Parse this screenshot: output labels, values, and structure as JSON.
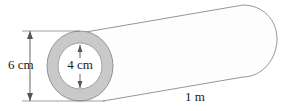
{
  "figure": {
    "shape_type": "hollow-cylinder",
    "colors": {
      "annulus_fill": "#c9c9c9",
      "inner_fill": "#ffffff",
      "body_fill": "#fdfdfd",
      "outline": "#8a8a8a",
      "dimension_line": "#555555",
      "text": "#1a1a1a",
      "background": "#ffffff"
    },
    "dimensions": {
      "outer_diameter": {
        "label": "6 cm",
        "value": 6,
        "unit": "cm",
        "orientation": "vertical",
        "position": "left-of-circle"
      },
      "inner_diameter": {
        "label": "4 cm",
        "value": 4,
        "unit": "cm",
        "orientation": "vertical",
        "position": "inside-inner-circle"
      },
      "length": {
        "label": "1 m",
        "value": 1,
        "unit": "m",
        "orientation": "along-axis",
        "position": "below-body"
      }
    },
    "geometry": {
      "circle_center_x": 80,
      "circle_center_y": 66,
      "outer_radius": 33,
      "inner_radius": 22,
      "body_right_x": 277
    }
  }
}
